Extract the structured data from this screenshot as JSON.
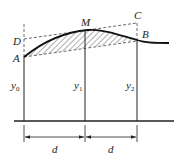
{
  "diagram": {
    "points": {
      "A": "A",
      "M": "M",
      "B": "B",
      "C": "C",
      "D": "D"
    },
    "ordinates": [
      {
        "base": "y",
        "sub": "0"
      },
      {
        "base": "y",
        "sub": "1"
      },
      {
        "base": "y",
        "sub": "2"
      }
    ],
    "spacing": [
      "d",
      "d"
    ],
    "colors": {
      "stroke": "#222222",
      "background": "#ffffff"
    }
  }
}
